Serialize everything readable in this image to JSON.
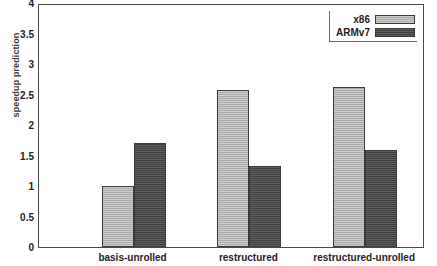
{
  "chart_data": {
    "type": "bar",
    "title": "",
    "xlabel": "",
    "ylabel": "speedup prediction",
    "categories": [
      "basis-unrolled",
      "restructured",
      "restructured-unrolled"
    ],
    "series": [
      {
        "name": "x86",
        "values": [
          1.0,
          2.58,
          2.62
        ],
        "color": "#b2b2b2"
      },
      {
        "name": "ARMv7",
        "values": [
          1.7,
          1.33,
          1.59
        ],
        "color": "#4d4d4d"
      }
    ],
    "ylim": [
      0,
      4
    ],
    "ytick_labels": [
      "0",
      "0.5",
      "1",
      "1.5",
      "2",
      "2.5",
      "3",
      "3.5",
      "4"
    ],
    "ytick_values": [
      0,
      0.5,
      1,
      1.5,
      2,
      2.5,
      3,
      3.5,
      4
    ],
    "grid": false,
    "legend_position": "top-right",
    "frame": true
  },
  "legend": {
    "entries": [
      {
        "label": "x86",
        "swatch": "x86-swatch"
      },
      {
        "label": "ARMv7",
        "swatch": "armv7-swatch"
      }
    ]
  },
  "axes": {
    "y_label": "speedup prediction"
  }
}
